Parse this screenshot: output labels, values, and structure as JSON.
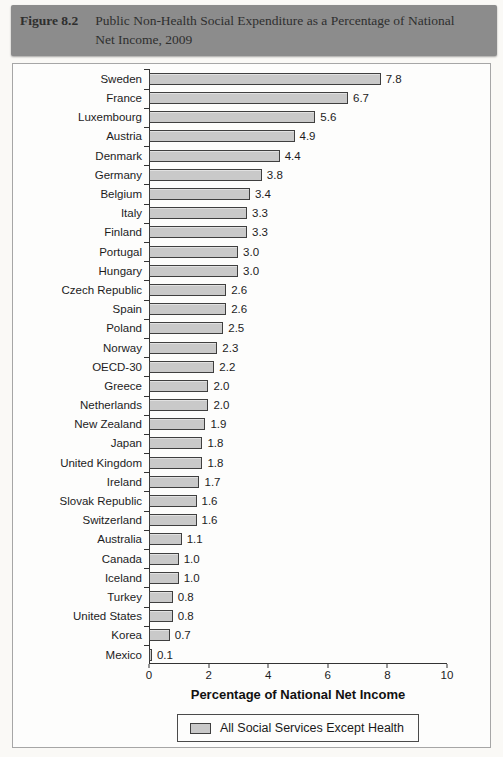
{
  "figure": {
    "label": "Figure 8.2",
    "title_lines": [
      "Public Non-Health Social Expenditure as a Percentage of National",
      "Net Income, 2009"
    ]
  },
  "chart_data": {
    "type": "bar",
    "orientation": "horizontal",
    "categories": [
      "Sweden",
      "France",
      "Luxembourg",
      "Austria",
      "Denmark",
      "Germany",
      "Belgium",
      "Italy",
      "Finland",
      "Portugal",
      "Hungary",
      "Czech Republic",
      "Spain",
      "Poland",
      "Norway",
      "OECD-30",
      "Greece",
      "Netherlands",
      "New Zealand",
      "Japan",
      "United Kingdom",
      "Ireland",
      "Slovak Republic",
      "Switzerland",
      "Australia",
      "Canada",
      "Iceland",
      "Turkey",
      "United States",
      "Korea",
      "Mexico"
    ],
    "values": [
      7.8,
      6.7,
      5.6,
      4.9,
      4.4,
      3.8,
      3.4,
      3.3,
      3.3,
      3.0,
      3.0,
      2.6,
      2.6,
      2.5,
      2.3,
      2.2,
      2.0,
      2.0,
      1.9,
      1.8,
      1.8,
      1.7,
      1.6,
      1.6,
      1.1,
      1.0,
      1.0,
      0.8,
      0.8,
      0.7,
      0.1
    ],
    "xlabel": "Percentage of National Net Income",
    "xlim": [
      0,
      10
    ],
    "x_ticks": [
      0,
      2,
      4,
      6,
      8,
      10
    ],
    "grid": false,
    "legend": {
      "position": "bottom",
      "label": "All Social Services Except Health"
    },
    "bar_color": "#c9c9c9",
    "bar_border": "#3f3f3f"
  },
  "colors": {
    "header_background": "#8c8c8c",
    "header_text": "#2f2f2f",
    "axis": "#333333"
  }
}
